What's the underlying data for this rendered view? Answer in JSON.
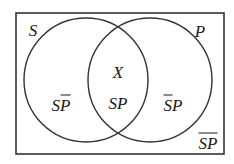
{
  "diagram": {
    "type": "venn",
    "universe_rect": {
      "x": 16,
      "y": 13,
      "width": 208,
      "height": 141
    },
    "sets": [
      {
        "name": "S",
        "label": "S",
        "cx": 86,
        "cy": 80,
        "r": 62
      },
      {
        "name": "P",
        "label": "P",
        "cx": 150,
        "cy": 80,
        "r": 62
      }
    ],
    "set_labels": {
      "S": "S",
      "P": "P"
    },
    "regions": {
      "s_not_p": {
        "a": "S",
        "b": "P",
        "overline": "P",
        "description": "S and not P"
      },
      "intersection_marker": "X",
      "s_and_p": {
        "text": "SP",
        "description": "S and P"
      },
      "not_s_p": {
        "a": "S",
        "b": "P",
        "overline": "S",
        "description": "not S and P"
      },
      "not_s_not_p": {
        "text": "SP",
        "overline": "SP",
        "description": "neither S nor P"
      }
    },
    "colors": {
      "stroke": "#333333",
      "text": "#1a1a1a",
      "background": "#ffffff"
    }
  }
}
